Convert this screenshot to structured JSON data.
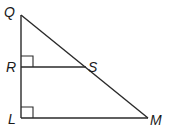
{
  "diagram": {
    "type": "geometry-triangle",
    "points": {
      "Q": {
        "label": "Q",
        "x": 21,
        "y": 15
      },
      "R": {
        "label": "R",
        "x": 21,
        "y": 67
      },
      "S": {
        "label": "S",
        "x": 86,
        "y": 67
      },
      "L": {
        "label": "L",
        "x": 21,
        "y": 118
      },
      "M": {
        "label": "M",
        "x": 148,
        "y": 118
      }
    },
    "segments": [
      "QL",
      "QM",
      "RS",
      "LM"
    ],
    "right_angles": [
      "QRS",
      "QLM"
    ]
  },
  "labels": {
    "Q": "Q",
    "R": "R",
    "S": "S",
    "L": "L",
    "M": "M"
  }
}
